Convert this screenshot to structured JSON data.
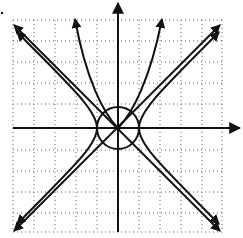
{
  "diagram": {
    "type": "coordinate-plane-sketch",
    "colors": {
      "ink": "#111111",
      "grid": "#555555",
      "background": "#ffffff"
    },
    "grid": {
      "cells_x": 10,
      "cells_y": 10,
      "style": "dotted"
    },
    "elements": [
      {
        "name": "x-axis",
        "arrow": "right"
      },
      {
        "name": "y-axis",
        "arrow": "up"
      },
      {
        "name": "unit-circle",
        "center": [
          0,
          0
        ],
        "radius_cells": 1
      },
      {
        "name": "line-y-equals-x",
        "arrows": "both"
      },
      {
        "name": "line-y-equals-negative-x",
        "arrows": "both"
      },
      {
        "name": "hyperbola-branches",
        "count": 4
      },
      {
        "name": "steep-curves-upward",
        "count": 2
      }
    ]
  }
}
